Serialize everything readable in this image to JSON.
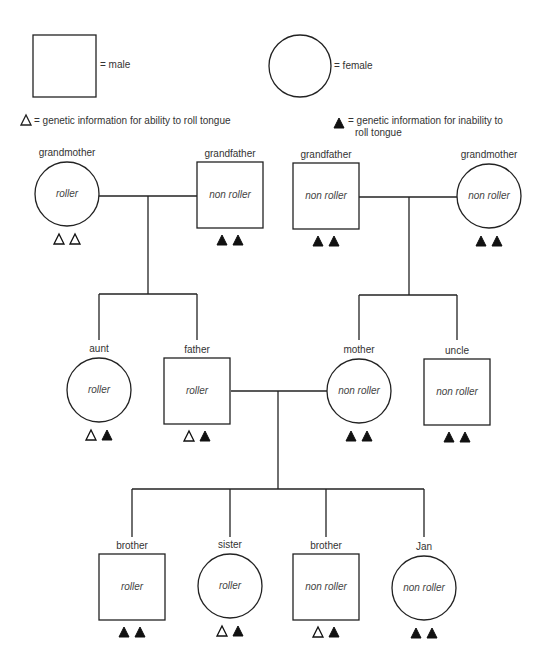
{
  "legend": {
    "male_label": "= male",
    "female_label": "= female",
    "open_triangle_label": "= genetic information for ability to roll tongue",
    "filled_triangle_label_line1": "= genetic information for inability to",
    "filled_triangle_label_line2": "roll tongue"
  },
  "people": [
    {
      "id": "gm-left",
      "relation": "grandmother",
      "sex": "female",
      "phenotype": "roller",
      "alleles": [
        "open",
        "open"
      ]
    },
    {
      "id": "gf-left",
      "relation": "grandfather",
      "sex": "male",
      "phenotype": "non roller",
      "alleles": [
        "filled",
        "filled"
      ]
    },
    {
      "id": "gf-right",
      "relation": "grandfather",
      "sex": "male",
      "phenotype": "non roller",
      "alleles": [
        "filled",
        "filled"
      ]
    },
    {
      "id": "gm-right",
      "relation": "grandmother",
      "sex": "female",
      "phenotype": "non roller",
      "alleles": [
        "filled",
        "filled"
      ]
    },
    {
      "id": "aunt",
      "relation": "aunt",
      "sex": "female",
      "phenotype": "roller",
      "alleles": [
        "open",
        "filled"
      ]
    },
    {
      "id": "father",
      "relation": "father",
      "sex": "male",
      "phenotype": "roller",
      "alleles": [
        "open",
        "filled"
      ]
    },
    {
      "id": "mother",
      "relation": "mother",
      "sex": "female",
      "phenotype": "non roller",
      "alleles": [
        "filled",
        "filled"
      ]
    },
    {
      "id": "uncle",
      "relation": "uncle",
      "sex": "male",
      "phenotype": "non roller",
      "alleles": [
        "filled",
        "filled"
      ]
    },
    {
      "id": "brother1",
      "relation": "brother",
      "sex": "male",
      "phenotype": "roller",
      "alleles": [
        "filled",
        "filled"
      ]
    },
    {
      "id": "sister",
      "relation": "sister",
      "sex": "female",
      "phenotype": "roller",
      "alleles": [
        "open",
        "filled"
      ]
    },
    {
      "id": "brother2",
      "relation": "brother",
      "sex": "male",
      "phenotype": "non roller",
      "alleles": [
        "open",
        "filled"
      ]
    },
    {
      "id": "jan",
      "relation": "Jan",
      "sex": "female",
      "phenotype": "non roller",
      "alleles": [
        "filled",
        "filled"
      ]
    }
  ],
  "colors": {
    "stroke": "#222222",
    "text": "#333333"
  }
}
